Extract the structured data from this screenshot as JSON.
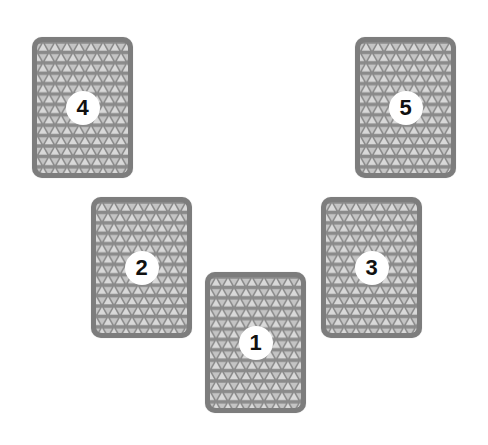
{
  "layout": {
    "title": "",
    "background": "#ffffff"
  },
  "colors": {
    "card_border": "#7d7d7d",
    "pattern_base": "#8a8a8a",
    "pattern_highlight": "#dadada",
    "badge_bg": "#ffffff",
    "badge_text": "#111111"
  },
  "cards": [
    {
      "position": 1,
      "label": "1",
      "x": 205,
      "y": 272
    },
    {
      "position": 2,
      "label": "2",
      "x": 91,
      "y": 197
    },
    {
      "position": 3,
      "label": "3",
      "x": 321,
      "y": 197
    },
    {
      "position": 4,
      "label": "4",
      "x": 32,
      "y": 37
    },
    {
      "position": 5,
      "label": "5",
      "x": 355,
      "y": 37
    }
  ]
}
